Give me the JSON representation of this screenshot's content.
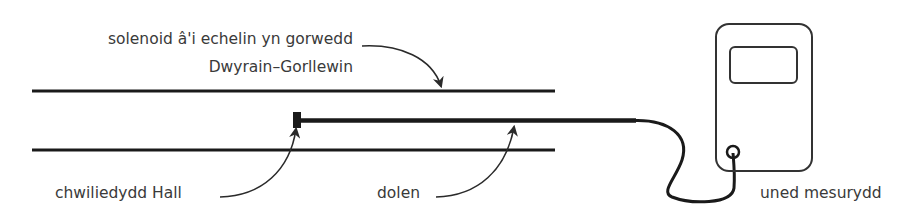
{
  "diagram": {
    "type": "apparatus-schematic",
    "labels": {
      "solenoid_line1": "solenoid â'i echelin yn gorwedd",
      "solenoid_line2": "Dwyrain–Gorllewin",
      "hall_probe": "chwiliedydd Hall",
      "loop": "dolen",
      "meter_unit": "uned mesurydd"
    },
    "components": [
      {
        "id": "solenoid",
        "description": "two parallel horizontal lines representing solenoid walls"
      },
      {
        "id": "hall-probe",
        "description": "small black square tip at the end of a rod inside the solenoid"
      },
      {
        "id": "probe-rod",
        "description": "thick horizontal rod running from probe along solenoid axis"
      },
      {
        "id": "cable",
        "description": "curved cable from rod end to meter connector"
      },
      {
        "id": "meter-unit",
        "description": "rounded rectangle device with display screen and connector socket"
      }
    ],
    "colors": {
      "stroke": "#1a1a1a",
      "text": "#3a3a3a",
      "background": "#ffffff"
    }
  }
}
